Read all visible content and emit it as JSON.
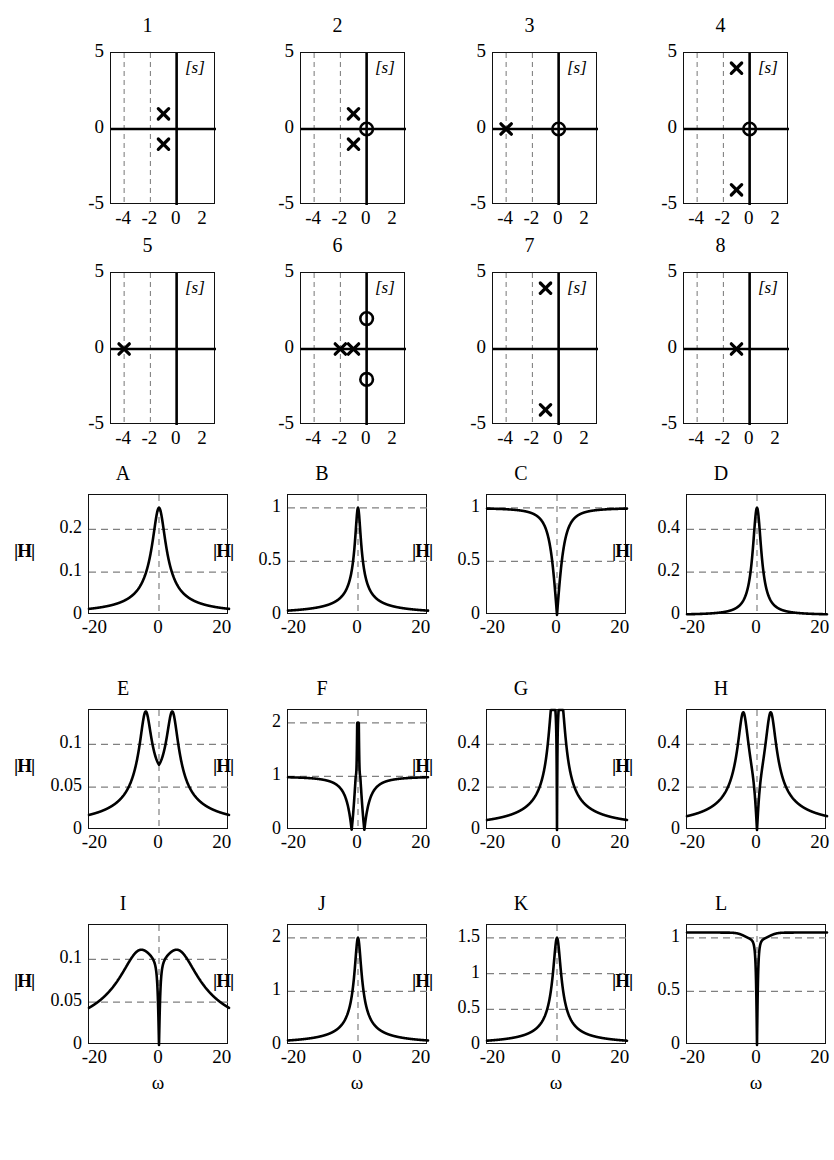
{
  "figure": {
    "pz_region_label": "[s]",
    "pz_axis": {
      "xticks": [
        "-4",
        "-2",
        "0",
        "2"
      ],
      "yticks": [
        "5",
        "0",
        "-5"
      ],
      "xlim": [
        -5,
        3
      ],
      "ylim": [
        -5,
        5
      ]
    },
    "mag_axis": {
      "xticks": [
        "-20",
        "0",
        "20"
      ],
      "xlim": [
        -22,
        22
      ],
      "xlabel": "ω",
      "ylabel": "|H|"
    }
  },
  "pz_plots": [
    {
      "title": "1",
      "poles": [
        [
          -1,
          1
        ],
        [
          -1,
          -1
        ]
      ],
      "zeros": []
    },
    {
      "title": "2",
      "poles": [
        [
          -1,
          1
        ],
        [
          -1,
          -1
        ]
      ],
      "zeros": [
        [
          0,
          0
        ]
      ]
    },
    {
      "title": "3",
      "poles": [
        [
          -4,
          0
        ]
      ],
      "zeros": [
        [
          0,
          0
        ]
      ]
    },
    {
      "title": "4",
      "poles": [
        [
          -1,
          4
        ],
        [
          -1,
          -4
        ]
      ],
      "zeros": [
        [
          0,
          0
        ]
      ]
    },
    {
      "title": "5",
      "poles": [
        [
          -4,
          0
        ]
      ],
      "zeros": []
    },
    {
      "title": "6",
      "poles": [
        [
          -2,
          0
        ],
        [
          -1,
          0
        ]
      ],
      "zeros": [
        [
          0,
          2
        ],
        [
          0,
          -2
        ]
      ]
    },
    {
      "title": "7",
      "poles": [
        [
          -1,
          4
        ],
        [
          -1,
          -4
        ]
      ],
      "zeros": []
    },
    {
      "title": "8",
      "poles": [
        [
          -1,
          0
        ]
      ],
      "zeros": []
    }
  ],
  "mag_plots": [
    {
      "title": "A",
      "yticks": [
        "0",
        "0.1",
        "0.2"
      ],
      "ytickvals": [
        0,
        0.1,
        0.2
      ],
      "ymax": 0.28,
      "gridy": [
        0.1,
        0.2
      ],
      "kind": "A"
    },
    {
      "title": "B",
      "yticks": [
        "0",
        "0.5",
        "1"
      ],
      "ytickvals": [
        0,
        0.5,
        1
      ],
      "ymax": 1.12,
      "gridy": [
        0.5,
        1
      ],
      "kind": "B"
    },
    {
      "title": "C",
      "yticks": [
        "0",
        "0.5",
        "1"
      ],
      "ytickvals": [
        0,
        0.5,
        1
      ],
      "ymax": 1.12,
      "gridy": [
        0.5,
        1
      ],
      "kind": "C"
    },
    {
      "title": "D",
      "yticks": [
        "0",
        "0.2",
        "0.4"
      ],
      "ytickvals": [
        0,
        0.2,
        0.4
      ],
      "ymax": 0.56,
      "gridy": [
        0.2,
        0.4
      ],
      "kind": "D"
    },
    {
      "title": "E",
      "yticks": [
        "0",
        "0.05",
        "0.1"
      ],
      "ytickvals": [
        0,
        0.05,
        0.1
      ],
      "ymax": 0.14,
      "gridy": [
        0.05,
        0.1
      ],
      "kind": "E"
    },
    {
      "title": "F",
      "yticks": [
        "0",
        "1",
        "2"
      ],
      "ytickvals": [
        0,
        1,
        2
      ],
      "ymax": 2.24,
      "gridy": [
        1,
        2
      ],
      "kind": "F"
    },
    {
      "title": "G",
      "yticks": [
        "0",
        "0.2",
        "0.4"
      ],
      "ytickvals": [
        0,
        0.2,
        0.4
      ],
      "ymax": 0.56,
      "gridy": [
        0.2,
        0.4
      ],
      "kind": "G"
    },
    {
      "title": "H",
      "yticks": [
        "0",
        "0.2",
        "0.4"
      ],
      "ytickvals": [
        0,
        0.2,
        0.4
      ],
      "ymax": 0.56,
      "gridy": [
        0.2,
        0.4
      ],
      "kind": "H"
    },
    {
      "title": "I",
      "yticks": [
        "0",
        "0.05",
        "0.1"
      ],
      "ytickvals": [
        0,
        0.05,
        0.1
      ],
      "ymax": 0.14,
      "gridy": [
        0.05,
        0.1
      ],
      "kind": "I"
    },
    {
      "title": "J",
      "yticks": [
        "0",
        "1",
        "2"
      ],
      "ytickvals": [
        0,
        1,
        2
      ],
      "ymax": 2.24,
      "gridy": [
        1,
        2
      ],
      "kind": "J"
    },
    {
      "title": "K",
      "yticks": [
        "0",
        "0.5",
        "1",
        "1.5"
      ],
      "ytickvals": [
        0,
        0.5,
        1,
        1.5
      ],
      "ymax": 1.68,
      "gridy": [
        0.5,
        1,
        1.5
      ],
      "kind": "K"
    },
    {
      "title": "L",
      "yticks": [
        "0",
        "0.5",
        "1"
      ],
      "ytickvals": [
        0,
        0.5,
        1
      ],
      "ymax": 1.12,
      "gridy": [
        0.5,
        1
      ],
      "kind": "L"
    }
  ],
  "chart_data": {
    "type": "line",
    "xlabel": "ω",
    "ylabel": "|H|",
    "panels_poles_zeros": [
      {
        "label": "1",
        "poles": [
          [
            -1,
            1
          ],
          [
            -1,
            -1
          ]
        ],
        "zeros": [],
        "xlim": [
          -5,
          3
        ],
        "ylim": [
          -5,
          5
        ],
        "plane": "[s]"
      },
      {
        "label": "2",
        "poles": [
          [
            -1,
            1
          ],
          [
            -1,
            -1
          ]
        ],
        "zeros": [
          [
            0,
            0
          ]
        ],
        "xlim": [
          -5,
          3
        ],
        "ylim": [
          -5,
          5
        ],
        "plane": "[s]"
      },
      {
        "label": "3",
        "poles": [
          [
            -4,
            0
          ]
        ],
        "zeros": [
          [
            0,
            0
          ]
        ],
        "xlim": [
          -5,
          3
        ],
        "ylim": [
          -5,
          5
        ],
        "plane": "[s]"
      },
      {
        "label": "4",
        "poles": [
          [
            -1,
            4
          ],
          [
            -1,
            -4
          ]
        ],
        "zeros": [
          [
            0,
            0
          ]
        ],
        "xlim": [
          -5,
          3
        ],
        "ylim": [
          -5,
          5
        ],
        "plane": "[s]"
      },
      {
        "label": "5",
        "poles": [
          [
            -4,
            0
          ]
        ],
        "zeros": [],
        "xlim": [
          -5,
          3
        ],
        "ylim": [
          -5,
          5
        ],
        "plane": "[s]"
      },
      {
        "label": "6",
        "poles": [
          [
            -2,
            0
          ],
          [
            -1,
            0
          ]
        ],
        "zeros": [
          [
            0,
            2
          ],
          [
            0,
            -2
          ]
        ],
        "xlim": [
          -5,
          3
        ],
        "ylim": [
          -5,
          5
        ],
        "plane": "[s]"
      },
      {
        "label": "7",
        "poles": [
          [
            -1,
            4
          ],
          [
            -1,
            -4
          ]
        ],
        "zeros": [],
        "xlim": [
          -5,
          3
        ],
        "ylim": [
          -5,
          5
        ],
        "plane": "[s]"
      },
      {
        "label": "8",
        "poles": [
          [
            -1,
            0
          ]
        ],
        "zeros": [],
        "xlim": [
          -5,
          3
        ],
        "ylim": [
          -5,
          5
        ],
        "plane": "[s]"
      }
    ],
    "panels_magnitude": [
      {
        "label": "A",
        "peak": 0.25,
        "peak_at": 0,
        "edge_value": 0.05,
        "ylim": [
          0,
          0.28
        ],
        "yticks": [
          0,
          0.1,
          0.2
        ],
        "shape": "single broad peak"
      },
      {
        "label": "B",
        "peak": 1.0,
        "peak_at": 0,
        "edge_value": 0.05,
        "ylim": [
          0,
          1.12
        ],
        "yticks": [
          0,
          0.5,
          1
        ],
        "shape": "single sharp peak"
      },
      {
        "label": "C",
        "peak": 1.0,
        "min": 0.0,
        "min_at": 0,
        "ylim": [
          0,
          1.12
        ],
        "yticks": [
          0,
          0.5,
          1
        ],
        "shape": "notch at 0, flat 1 elsewhere"
      },
      {
        "label": "D",
        "peak": 0.5,
        "peak_at": 0,
        "edge_value": 0.01,
        "ylim": [
          0,
          0.56
        ],
        "yticks": [
          0,
          0.2,
          0.4
        ],
        "shape": "single narrow peak"
      },
      {
        "label": "E",
        "peak": 0.125,
        "peak_at": [
          -4,
          4
        ],
        "center_dip": 0.06,
        "edge_value": 0.01,
        "ylim": [
          0,
          0.14
        ],
        "yticks": [
          0,
          0.05,
          0.1
        ],
        "shape": "double peak, shallow center dip"
      },
      {
        "label": "F",
        "peak": 2.0,
        "peak_at": 0,
        "min": 0.0,
        "min_at": [
          -2,
          2
        ],
        "baseline": 1.0,
        "ylim": [
          0,
          2.24
        ],
        "yticks": [
          0,
          1,
          2
        ],
        "shape": "center spike with two notches"
      },
      {
        "label": "G",
        "peak": 0.5,
        "peak_at": [
          -1,
          1
        ],
        "min": 0.0,
        "min_at": 0,
        "edge_value": 0.05,
        "ylim": [
          0,
          0.56
        ],
        "yticks": [
          0,
          0.2,
          0.4
        ],
        "shape": "narrow notch within broad peak"
      },
      {
        "label": "H",
        "peak": 0.5,
        "peak_at": [
          -4,
          4
        ],
        "min": 0.0,
        "min_at": 0,
        "edge_value": 0.05,
        "ylim": [
          0,
          0.56
        ],
        "yticks": [
          0,
          0.2,
          0.4
        ],
        "shape": "double peak with deep center notch"
      },
      {
        "label": "I",
        "peak": 0.125,
        "peak_at": [
          -6,
          6
        ],
        "min": 0.0,
        "min_at": 0,
        "edge_value": 0.05,
        "ylim": [
          0,
          0.14
        ],
        "yticks": [
          0,
          0.05,
          0.1
        ],
        "shape": "broad double peak with center notch"
      },
      {
        "label": "J",
        "peak": 2.0,
        "peak_at": 0,
        "edge_value": 0.06,
        "ylim": [
          0,
          2.24
        ],
        "yticks": [
          0,
          1,
          2
        ],
        "shape": "single sharp peak"
      },
      {
        "label": "K",
        "peak": 1.5,
        "peak_at": 0,
        "edge_value": 0.06,
        "ylim": [
          0,
          1.68
        ],
        "yticks": [
          0,
          0.5,
          1,
          1.5
        ],
        "shape": "single sharp peak"
      },
      {
        "label": "L",
        "peak": 1.05,
        "min": 0.0,
        "min_at": 0,
        "baseline": 1.0,
        "ylim": [
          0,
          1.12
        ],
        "yticks": [
          0,
          0.5,
          1
        ],
        "shape": "flat 1 with deep narrow notch"
      }
    ]
  }
}
